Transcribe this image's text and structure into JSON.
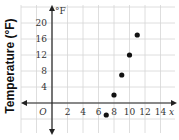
{
  "chart_data": {
    "type": "scatter",
    "title": "",
    "xlabel": "x",
    "ylabel": "Temperature (°F)",
    "y_axis_unit_label": "°F",
    "origin_label": "O",
    "x_ticks": [
      2,
      4,
      6,
      8,
      10,
      12,
      14
    ],
    "y_ticks": [
      4,
      8,
      12,
      16,
      20
    ],
    "xlim": [
      -3,
      15
    ],
    "ylim": [
      -6,
      24
    ],
    "grid": true,
    "legend": null,
    "points": [
      {
        "x": 7,
        "y": -3
      },
      {
        "x": 8,
        "y": 2
      },
      {
        "x": 9,
        "y": 7
      },
      {
        "x": 10,
        "y": 12
      },
      {
        "x": 11,
        "y": 17
      }
    ],
    "colors": {
      "grid": "#d6d6d6",
      "axis": "#222222",
      "points": "#111111"
    }
  }
}
